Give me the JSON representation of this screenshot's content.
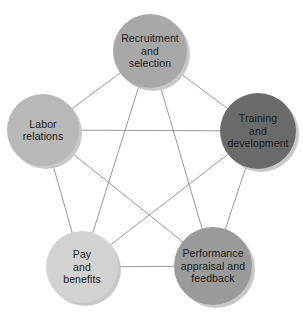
{
  "diagram": {
    "type": "network-pentagon",
    "background_color": "#ffffff",
    "edge_color": "#8c8c8c",
    "edge_width": 0.9,
    "shadow_color": "#c8c8c8",
    "label_color": "#1a1a1a",
    "nodes": [
      {
        "id": "recruitment",
        "name": "recruitment-and-selection",
        "lines": [
          "Recruitment",
          "and",
          "selection"
        ],
        "cx": 150,
        "cy": 51,
        "r": 37,
        "color": "#a8a8a8"
      },
      {
        "id": "training",
        "name": "training-and-development",
        "lines": [
          "Training",
          "and",
          "development"
        ],
        "cx": 258,
        "cy": 131,
        "r": 38,
        "color": "#6a6a6a"
      },
      {
        "id": "performance",
        "name": "performance-appraisal-and-feedback",
        "lines": [
          "Performance",
          "appraisal and",
          "feedback"
        ],
        "cx": 213,
        "cy": 266,
        "r": 39,
        "color": "#9a9a9a"
      },
      {
        "id": "pay",
        "name": "pay-and-benefits",
        "lines": [
          "Pay",
          "and",
          "benefits"
        ],
        "cx": 82,
        "cy": 267,
        "r": 36,
        "color": "#d2d2d2"
      },
      {
        "id": "labor",
        "name": "labor-relations",
        "lines": [
          "Labor",
          "relations"
        ],
        "cx": 43,
        "cy": 130,
        "r": 36,
        "color": "#b8b8b8"
      }
    ],
    "edges": [
      {
        "from": "recruitment",
        "to": "training",
        "kind": "pentagon-side"
      },
      {
        "from": "training",
        "to": "performance",
        "kind": "pentagon-side"
      },
      {
        "from": "performance",
        "to": "pay",
        "kind": "pentagon-side"
      },
      {
        "from": "pay",
        "to": "labor",
        "kind": "pentagon-side"
      },
      {
        "from": "labor",
        "to": "recruitment",
        "kind": "pentagon-side"
      },
      {
        "from": "recruitment",
        "to": "performance",
        "kind": "diagonal"
      },
      {
        "from": "recruitment",
        "to": "pay",
        "kind": "diagonal"
      },
      {
        "from": "training",
        "to": "pay",
        "kind": "diagonal"
      },
      {
        "from": "training",
        "to": "labor",
        "kind": "diagonal"
      },
      {
        "from": "performance",
        "to": "labor",
        "kind": "diagonal"
      }
    ]
  }
}
